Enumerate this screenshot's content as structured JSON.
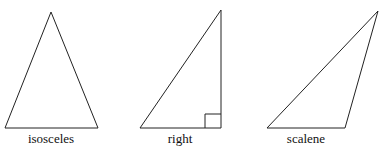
{
  "diagram": {
    "type": "triangle-classification",
    "stroke_color": "#222222",
    "triangles": [
      {
        "label": "isosceles",
        "points": [
          [
            51,
            12
          ],
          [
            5,
            128
          ],
          [
            98,
            128
          ]
        ],
        "right_angle_marker": false
      },
      {
        "label": "right",
        "points": [
          [
            221,
            10
          ],
          [
            140,
            128
          ],
          [
            221,
            128
          ]
        ],
        "right_angle_marker": true
      },
      {
        "label": "scalene",
        "points": [
          [
            378,
            11
          ],
          [
            267,
            128
          ],
          [
            345,
            128
          ]
        ],
        "right_angle_marker": false
      }
    ]
  }
}
